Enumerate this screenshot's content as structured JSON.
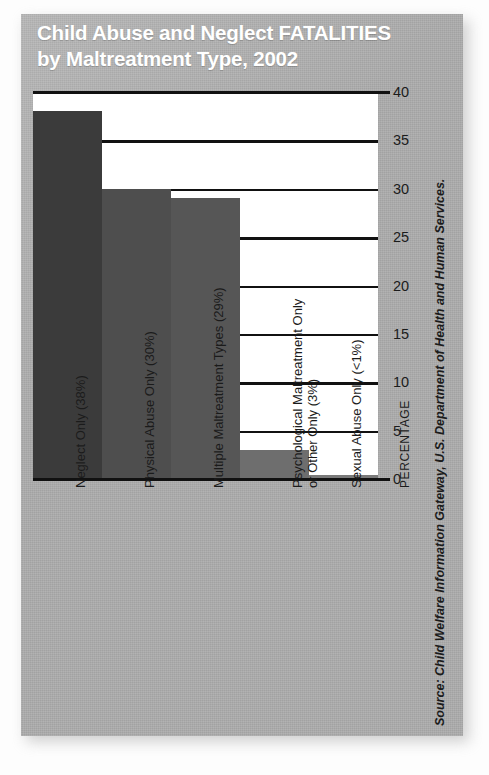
{
  "title": {
    "line1": "Child Abuse and Neglect FATALITIES",
    "line2": "by Maltreatment Type, 2002"
  },
  "source": "Source: Child Welfare Information Gateway,  U.S. Department of Health and  Human Services.",
  "axis": {
    "y_title": "PERCENTAGE",
    "ticks": [
      "40",
      "35",
      "30",
      "25",
      "20",
      "15",
      "10",
      "5",
      "0"
    ]
  },
  "colors": {
    "panel": "#adadad",
    "plot_background": "#ffffff",
    "gridline": "#111111",
    "title_text": "#ffffff",
    "label_text": "#1b1b1b",
    "bar1": "#3b3b3b",
    "bar2": "#4e4e4e",
    "bar3": "#565656",
    "bar4": "#6e6e6e",
    "bar5": "#7a7a7a"
  },
  "chart_data": {
    "type": "bar",
    "title": "Child Abuse and Neglect FATALITIES by Maltreatment Type, 2002",
    "xlabel": "",
    "ylabel": "PERCENTAGE",
    "ylim": [
      0,
      40
    ],
    "yticks": [
      0,
      5,
      10,
      15,
      20,
      25,
      30,
      35,
      40
    ],
    "grid": true,
    "legend": "none",
    "categories": [
      "Neglect Only (38%)",
      "Physical Abuse Only (30%)",
      "Multiple Maltreatment Types (29%)",
      "Psychological Maltreatment Only or Other Only (3%)",
      "Sexual Abuse Only (<1%)"
    ],
    "values": [
      38,
      30,
      29,
      3,
      0.4
    ],
    "value_labels": [
      "38%",
      "30%",
      "29%",
      "3%",
      "<1%"
    ],
    "bars": [
      {
        "label_line1": "Neglect Only (38%)",
        "label_line2": "",
        "value": 38,
        "color": "#3b3b3b"
      },
      {
        "label_line1": "Physical Abuse Only (30%)",
        "label_line2": "",
        "value": 30,
        "color": "#4e4e4e"
      },
      {
        "label_line1": "Multiple Maltreatment Types (29%)",
        "label_line2": "",
        "value": 29,
        "color": "#565656"
      },
      {
        "label_line1": "Psychological Maltreatment Only",
        "label_line2": "or Other Only (3%)",
        "value": 3,
        "color": "#6e6e6e"
      },
      {
        "label_line1": "Sexual Abuse Only (<1%)",
        "label_line2": "",
        "value": 0.4,
        "color": "#7a7a7a"
      }
    ]
  }
}
